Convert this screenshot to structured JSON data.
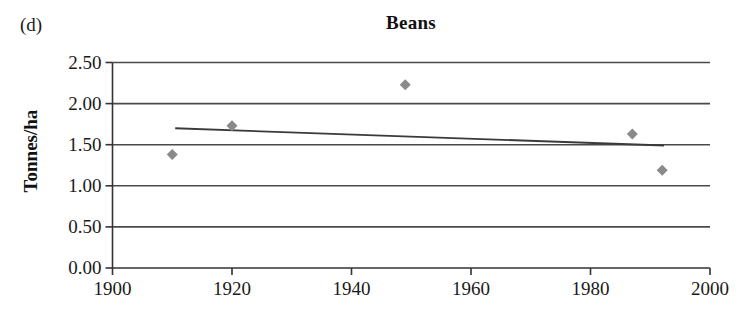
{
  "figure": {
    "panel_label": "(d)",
    "background_color": "#ffffff"
  },
  "chart_data": {
    "type": "scatter",
    "title": "Beans",
    "xlabel": "",
    "ylabel": "Tonnes/ha",
    "xlim": [
      1900,
      2000
    ],
    "ylim": [
      0.0,
      2.5
    ],
    "grid": true,
    "grid_axis": "y",
    "legend": null,
    "x_ticks": [
      1900,
      1920,
      1940,
      1960,
      1980,
      2000
    ],
    "x_tick_labels": [
      "1900",
      "1920",
      "1940",
      "1960",
      "1980",
      "2000"
    ],
    "y_ticks": [
      0.0,
      0.5,
      1.0,
      1.5,
      2.0,
      2.5
    ],
    "y_tick_labels": [
      "0.00",
      "0.50",
      "1.00",
      "1.50",
      "2.00",
      "2.50"
    ],
    "x": [
      1910,
      1920,
      1949,
      1987,
      1992
    ],
    "y": [
      1.38,
      1.73,
      2.23,
      1.63,
      1.19
    ],
    "points": [
      {
        "x": 1910,
        "y": 1.38
      },
      {
        "x": 1920,
        "y": 1.73
      },
      {
        "x": 1949,
        "y": 2.23
      },
      {
        "x": 1987,
        "y": 1.63
      },
      {
        "x": 1992,
        "y": 1.19
      }
    ],
    "marker": "diamond",
    "marker_color": "#8a8a8a",
    "marker_size": 11,
    "trendline": {
      "type": "linear",
      "x_start": 1910.5,
      "y_start": 1.7,
      "x_end": 1992.3,
      "y_end": 1.49,
      "color": "#3a3a3a"
    },
    "axis_color": "#333333",
    "gridline_color": "#4a4a4a"
  }
}
